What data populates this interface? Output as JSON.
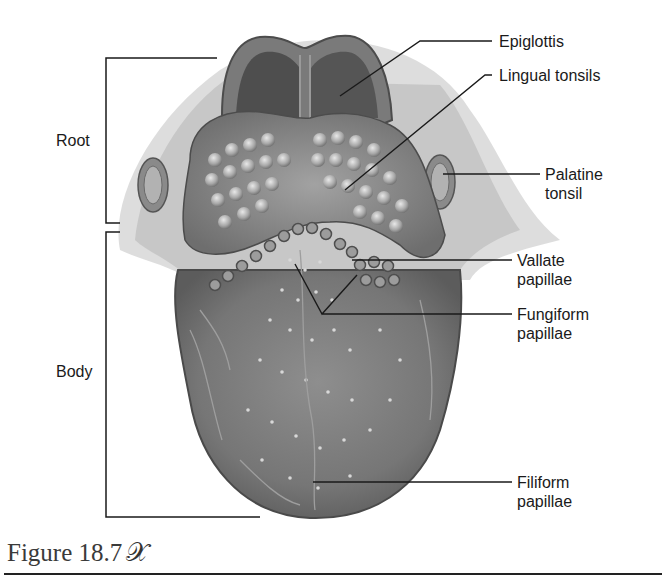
{
  "figure": {
    "caption": "Figure 18.7",
    "caption_icon": "figure-man-icon"
  },
  "regions": [
    {
      "id": "root",
      "label": "Root"
    },
    {
      "id": "body",
      "label": "Body"
    }
  ],
  "labels": [
    {
      "id": "epiglottis",
      "text": "Epiglottis"
    },
    {
      "id": "lingual-tonsils",
      "text": "Lingual tonsils"
    },
    {
      "id": "palatine-tonsil",
      "text": "Palatine\ntonsil"
    },
    {
      "id": "vallate-papillae",
      "text": "Vallate\npapillae"
    },
    {
      "id": "fungiform-papillae",
      "text": "Fungiform\npapillae"
    },
    {
      "id": "filiform-papillae",
      "text": "Filiform\npapillae"
    }
  ],
  "colors": {
    "line": "#1a1a1a",
    "tissue_dark": "#5a5a5a",
    "tissue_mid": "#8a8a8a",
    "tissue_light": "#c4c4c4"
  }
}
